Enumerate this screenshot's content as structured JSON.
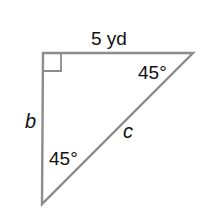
{
  "diagram": {
    "type": "right-triangle",
    "top_side_label": "5 yd",
    "left_side_label": "b",
    "hypotenuse_label": "c",
    "top_right_angle_label": "45°",
    "bottom_angle_label": "45°",
    "right_angle_marker": true,
    "stroke_color": "#8c8c8c",
    "text_color": "#111111"
  }
}
